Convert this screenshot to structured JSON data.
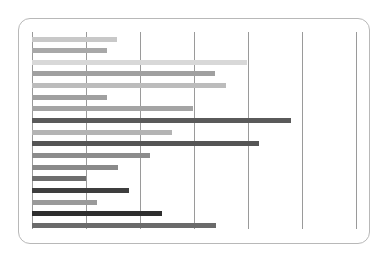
{
  "chart_data": {
    "type": "bar",
    "orientation": "horizontal",
    "title": "",
    "xlabel": "",
    "ylabel": "",
    "xlim": [
      0,
      6
    ],
    "grid": true,
    "gridlines_x": [
      0,
      1,
      2,
      3,
      4,
      5,
      6
    ],
    "legend": null,
    "categories": [
      "1",
      "2",
      "3",
      "4",
      "5",
      "6",
      "7",
      "8",
      "9",
      "10",
      "11",
      "12",
      "13",
      "14",
      "15",
      "16",
      "17"
    ],
    "values": [
      1.57,
      1.39,
      3.98,
      3.39,
      3.59,
      1.39,
      2.98,
      4.8,
      2.59,
      4.2,
      2.19,
      1.59,
      1.0,
      1.8,
      1.2,
      2.41,
      3.41
    ],
    "colors": [
      "#c8c8c8",
      "#a8a8a8",
      "#d8d8d8",
      "#a0a0a0",
      "#bcbcbc",
      "#a0a0a0",
      "#a4a4a4",
      "#5a5a5a",
      "#b4b4b4",
      "#555555",
      "#8c8c8c",
      "#8a8a8a",
      "#6e6e6e",
      "#3e3e3e",
      "#9a9a9a",
      "#2e2e2e",
      "#6a6a6a"
    ]
  }
}
